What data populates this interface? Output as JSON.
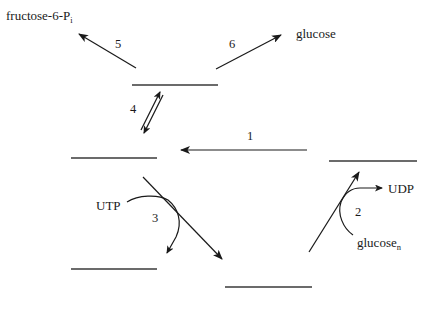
{
  "diagram": {
    "type": "metabolic-pathway-fill-in",
    "colors": {
      "background": "#ffffff",
      "ink": "#1a1a1a",
      "blank_line": "#3a3a3a"
    },
    "blanks": [
      {
        "id": "blank-top",
        "x1": 132,
        "x2": 218,
        "y": 85
      },
      {
        "id": "blank-middle-left",
        "x1": 71,
        "x2": 157,
        "y": 158
      },
      {
        "id": "blank-right",
        "x1": 329,
        "x2": 417,
        "y": 161
      },
      {
        "id": "blank-bottom-left",
        "x1": 71,
        "x2": 157,
        "y": 269
      },
      {
        "id": "blank-bottom-middle",
        "x1": 225,
        "x2": 312,
        "y": 287
      }
    ],
    "products": {
      "fructose": {
        "main": "fructose-6-P",
        "subscript": "i"
      },
      "glucose": "glucose",
      "utp": "UTP",
      "udp": "UDP",
      "glucose_n": {
        "main": "glucose",
        "subscript": "n"
      }
    },
    "reactions": [
      {
        "number": "1",
        "from": "blank-right",
        "to": "blank-middle-left"
      },
      {
        "number": "2",
        "from": "blank-bottom-middle",
        "to": "blank-right",
        "cosubstrates": [
          "glucose_n",
          "UDP"
        ]
      },
      {
        "number": "3",
        "from": "blank-middle-left",
        "to": "blank-bottom-middle",
        "cosubstrates": [
          "UTP"
        ]
      },
      {
        "number": "4",
        "between": [
          "blank-top",
          "blank-middle-left"
        ],
        "reversible": true
      },
      {
        "number": "5",
        "from": "blank-top",
        "to": "fructose-6-Pi"
      },
      {
        "number": "6",
        "from": "blank-top",
        "to": "glucose"
      }
    ],
    "labels": {
      "r1": "1",
      "r2": "2",
      "r3": "3",
      "r4": "4",
      "r5": "5",
      "r6": "6"
    }
  }
}
